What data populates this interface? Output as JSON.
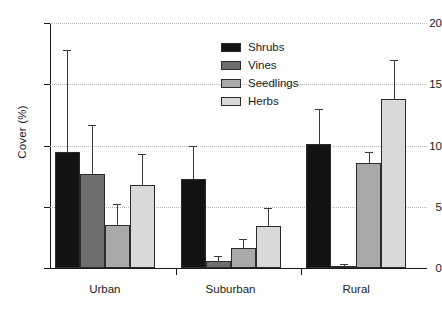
{
  "chart_data": {
    "type": "bar",
    "title": "",
    "xlabel": "",
    "ylabel": "Cover (%)",
    "categories": [
      "Urban",
      "Suburban",
      "Rural"
    ],
    "ylim": [
      0,
      20
    ],
    "yticks": [
      0,
      5,
      10,
      15,
      20
    ],
    "ytick_labels": [
      "0",
      "5",
      "10",
      "15",
      "20"
    ],
    "grid": true,
    "grid_axis": "y",
    "legend_position": "upper center",
    "errorbars": "upper only",
    "series": [
      {
        "name": "Shrubs",
        "color": "#131313",
        "values": [
          9.5,
          7.3,
          10.1
        ],
        "err_upper": [
          8.3,
          2.7,
          2.9
        ],
        "err_top": [
          17.8,
          10.0,
          13.0
        ]
      },
      {
        "name": "Vines",
        "color": "#6e6e6e",
        "values": [
          7.7,
          0.6,
          0.2
        ],
        "err_upper": [
          4.0,
          0.4,
          0.1
        ],
        "err_top": [
          11.7,
          1.0,
          0.3
        ]
      },
      {
        "name": "Seedlings",
        "color": "#a9a9a9",
        "values": [
          3.5,
          1.6,
          8.6
        ],
        "err_upper": [
          1.7,
          0.8,
          0.9
        ],
        "err_top": [
          5.2,
          2.4,
          9.5
        ]
      },
      {
        "name": "Herbs",
        "color": "#d9d9d9",
        "values": [
          6.8,
          3.4,
          13.8
        ],
        "err_upper": [
          2.5,
          1.5,
          3.2
        ],
        "err_top": [
          9.3,
          4.9,
          17.0
        ]
      }
    ]
  },
  "legend": {
    "items": [
      {
        "label": "Shrubs",
        "color": "#131313"
      },
      {
        "label": "Vines",
        "color": "#6e6e6e"
      },
      {
        "label": "Seedlings",
        "color": "#a9a9a9"
      },
      {
        "label": "Herbs",
        "color": "#d9d9d9"
      }
    ]
  },
  "colors": {
    "axis": "#1a1a1a",
    "grid": "#b9b9b9",
    "background": "#ffffff"
  }
}
